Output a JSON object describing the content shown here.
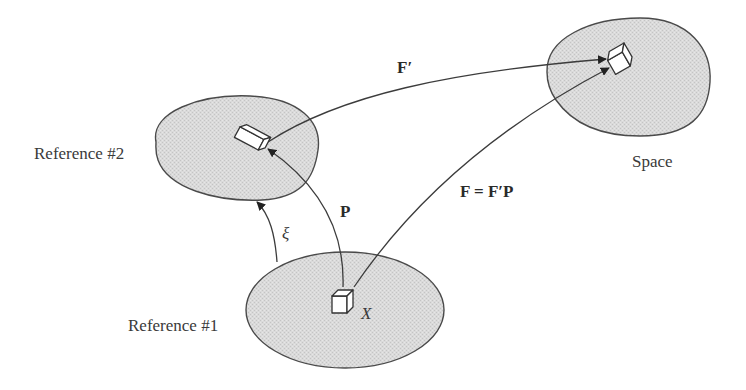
{
  "diagram": {
    "type": "configuration-mapping",
    "colors": {
      "region_fill": "#d9d9d9",
      "stroke": "#3c3c3c",
      "text": "#3a3a3a"
    },
    "regions": [
      {
        "id": "reference-1",
        "label": "Reference #1"
      },
      {
        "id": "reference-2",
        "label": "Reference #2"
      },
      {
        "id": "space",
        "label": "Space"
      }
    ],
    "point_label": "X",
    "mappings": [
      {
        "id": "xi",
        "from": "reference-1",
        "to": "reference-2",
        "label": "ξ",
        "style": "italic"
      },
      {
        "id": "P",
        "from": "reference-1",
        "to": "reference-2",
        "label": "P",
        "style": "bold"
      },
      {
        "id": "F-prime",
        "from": "reference-2",
        "to": "space",
        "label": "F′",
        "style": "bold"
      },
      {
        "id": "F",
        "from": "reference-1",
        "to": "space",
        "label": "F = F′P",
        "style": "bold"
      }
    ]
  }
}
